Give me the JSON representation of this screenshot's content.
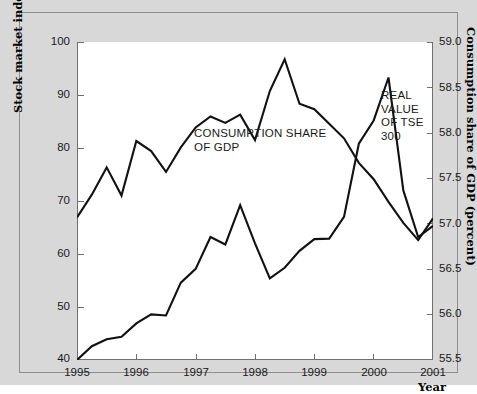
{
  "figure": {
    "background_color": "#d8d8d8",
    "plot_background_color": "#ffffff",
    "line_color": "#111111"
  },
  "axes": {
    "left": {
      "title": "Stock market index",
      "ticks": [
        "100",
        "90",
        "80",
        "70",
        "60",
        "50",
        "40"
      ],
      "min": 40,
      "max": 100
    },
    "right": {
      "title": "Consumption share of GDP (percent)",
      "ticks": [
        "59.0",
        "58.5",
        "58.0",
        "57.5",
        "57.0",
        "56.5",
        "56.0",
        "55.5"
      ],
      "min": 55.5,
      "max": 59.0
    },
    "bottom": {
      "title": "Year",
      "ticks": [
        "1995",
        "1996",
        "1997",
        "1998",
        "1999",
        "2000",
        "2001"
      ],
      "min": 1995,
      "max": 2001
    }
  },
  "annotations": {
    "consumption": "CONSUMPTION SHARE\nOF GDP",
    "tse": "REAL VALUE\nOF TSE 300"
  },
  "chart_data": {
    "type": "line",
    "title": "",
    "subtitle": "",
    "xlabel": "Year",
    "ylabel": "Stock market index",
    "ylabel_right": "Consumption share of GDP (percent)",
    "xlim": [
      1995,
      2001
    ],
    "ylim": [
      40,
      100
    ],
    "ylim_right": [
      55.5,
      59.0
    ],
    "grid": false,
    "legend": "inline-annotations",
    "yticks": [
      40,
      50,
      60,
      70,
      80,
      90,
      100
    ],
    "yticks_right": [
      55.5,
      56.0,
      56.5,
      57.0,
      57.5,
      58.0,
      58.5,
      59.0
    ],
    "xticks": [
      1995,
      1996,
      1997,
      1998,
      1999,
      2000,
      2001
    ],
    "series": [
      {
        "name": "CONSUMPTION SHARE OF GDP",
        "axis": "right",
        "units": "percent of GDP",
        "x": [
          1995.0,
          1995.25,
          1995.5,
          1995.75,
          1996.0,
          1996.25,
          1996.5,
          1996.75,
          1997.0,
          1997.25,
          1997.5,
          1997.75,
          1998.0,
          1998.25,
          1998.5,
          1998.75,
          1999.0,
          1999.25,
          1999.5,
          1999.75,
          2000.0,
          2000.25,
          2000.5,
          2000.75,
          2001.0
        ],
        "y": [
          57.07,
          57.32,
          57.62,
          57.31,
          57.91,
          57.8,
          57.57,
          57.84,
          58.06,
          58.18,
          58.11,
          58.2,
          57.92,
          58.46,
          58.81,
          58.32,
          58.26,
          58.1,
          57.94,
          57.67,
          57.49,
          57.24,
          57.01,
          56.82,
          57.06
        ]
      },
      {
        "name": "REAL VALUE OF TSE 300",
        "axis": "left",
        "units": "index",
        "x": [
          1995.0,
          1995.25,
          1995.5,
          1995.75,
          1996.0,
          1996.25,
          1996.5,
          1996.75,
          1997.0,
          1997.25,
          1997.5,
          1997.75,
          1998.0,
          1998.25,
          1998.5,
          1998.75,
          1999.0,
          1999.25,
          1999.5,
          1999.75,
          2000.0,
          2000.25,
          2000.5,
          2000.75,
          2001.0
        ],
        "y": [
          40.0,
          42.6,
          43.9,
          44.4,
          46.9,
          48.6,
          48.4,
          54.6,
          57.2,
          63.2,
          61.8,
          69.2,
          62.0,
          55.4,
          57.4,
          60.6,
          62.8,
          62.9,
          67.0,
          80.8,
          85.2,
          93.3,
          72.0,
          63.2,
          65.3
        ]
      }
    ]
  }
}
